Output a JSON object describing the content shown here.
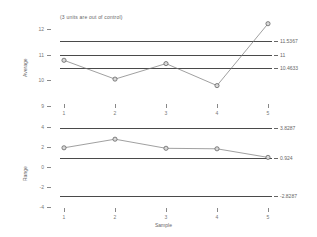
{
  "annotation": {
    "text": "(3 units are out of control)"
  },
  "xaxis": {
    "label": "Sample",
    "ticks": [
      "1",
      "2",
      "3",
      "4",
      "5"
    ]
  },
  "charts": [
    {
      "name": "average-chart",
      "ylabel": "Average",
      "yticks": [
        "12",
        "11",
        "10",
        "9"
      ],
      "limits": [
        {
          "name": "ucl",
          "label": "11.5367",
          "value": 11.5367
        },
        {
          "name": "center",
          "label": "11",
          "value": 11
        },
        {
          "name": "lcl",
          "label": "10.4633",
          "value": 10.4633
        }
      ]
    },
    {
      "name": "range-chart",
      "ylabel": "Range",
      "yticks": [
        "4",
        "2",
        "0",
        "-2",
        "-4"
      ],
      "limits": [
        {
          "name": "ucl",
          "label": "3.8287",
          "value": 3.8287
        },
        {
          "name": "center",
          "label": "0.924",
          "value": 0.924
        },
        {
          "name": "lcl",
          "label": "-2.8287",
          "value": -2.8287
        }
      ]
    }
  ],
  "chart_data": [
    {
      "type": "line",
      "title": "(3 units are out of control)",
      "name": "average-chart",
      "xlabel": "Sample",
      "ylabel": "Average",
      "x": [
        1,
        2,
        3,
        4,
        5
      ],
      "categories": [
        "1",
        "2",
        "3",
        "4",
        "5"
      ],
      "values": [
        10.78,
        10.05,
        10.65,
        9.8,
        12.2
      ],
      "ylim": [
        9,
        12.4
      ],
      "xlim": [
        0.6,
        5.4
      ],
      "yticks": [
        12,
        11,
        10,
        9
      ],
      "grid": false,
      "legend": "none",
      "control_limits": {
        "ucl": 11.5367,
        "center": 11,
        "lcl": 10.4633
      },
      "out_of_control_points": [
        5
      ]
    },
    {
      "type": "line",
      "name": "range-chart",
      "xlabel": "Sample",
      "ylabel": "Range",
      "x": [
        1,
        2,
        3,
        4,
        5
      ],
      "categories": [
        "1",
        "2",
        "3",
        "4",
        "5"
      ],
      "values": [
        1.9,
        2.75,
        1.85,
        1.8,
        0.95
      ],
      "ylim": [
        -4.4,
        4.4
      ],
      "xlim": [
        0.6,
        5.4
      ],
      "yticks": [
        4,
        2,
        0,
        -2,
        -4
      ],
      "grid": false,
      "legend": "none",
      "control_limits": {
        "ucl": 3.8287,
        "center": 0.924,
        "lcl": -2.8287
      }
    }
  ]
}
